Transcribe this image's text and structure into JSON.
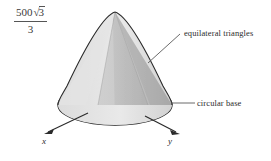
{
  "figure": {
    "kind": "cone-solid-diagram",
    "expression": {
      "numerator_coefficient": "500",
      "numerator_radical_sign": "√",
      "numerator_radicand": "3",
      "denominator": "3",
      "plain": "500√3/3"
    },
    "labels": {
      "equilateral": "equilateral triangles",
      "circular_base": "circular base"
    },
    "axes": {
      "x_label": "x",
      "y_label": "y"
    },
    "colors": {
      "outline": "#1c1c1c",
      "light_face": "#e2e2e2",
      "mid_face": "#c9c9c9",
      "dark_face": "#a8a8a8",
      "base_light": "#d5d5d5",
      "base_dark": "#b0b0b0",
      "dashed_line": "#6f6f6f",
      "leader_line": "#5a5a5a",
      "text": "#2b2b2b"
    }
  }
}
